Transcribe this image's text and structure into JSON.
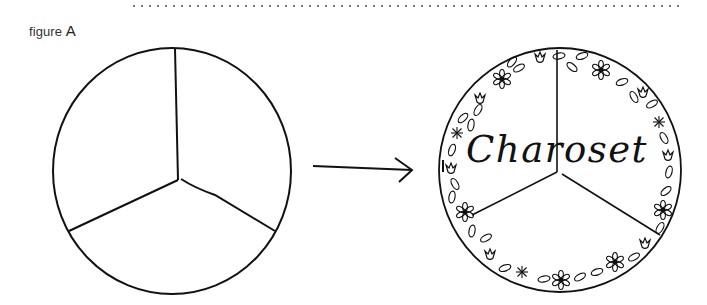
{
  "figure": {
    "label_prefix": "figure",
    "label_letter": "A"
  },
  "left_plate": {
    "description": "empty circle divided into three sections",
    "sections": 3
  },
  "arrow": {
    "direction": "right"
  },
  "right_plate": {
    "text": "Charoset",
    "sections": 3,
    "border_decoration": [
      "flower-icon",
      "tulip-icon",
      "leaf-icon",
      "starburst-icon"
    ]
  },
  "colors": {
    "ink": "#111111",
    "background": "#ffffff",
    "dotted_rule": "#777777"
  }
}
